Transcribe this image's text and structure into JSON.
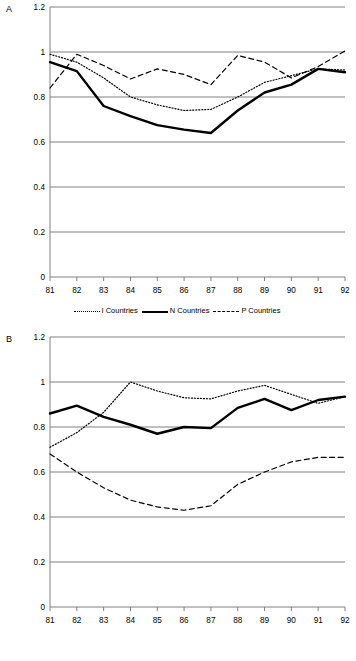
{
  "figure": {
    "panels": [
      {
        "letter": "A"
      },
      {
        "letter": "B"
      }
    ]
  },
  "panel_a": {
    "letter": "A",
    "y_ticks": [
      "0",
      "0.2",
      "0.4",
      "0.6",
      "0.8",
      "1",
      "1.2"
    ],
    "x_ticks": [
      "81",
      "82",
      "83",
      "84",
      "85",
      "86",
      "87",
      "88",
      "89",
      "90",
      "91",
      "92"
    ],
    "legend": [
      {
        "label": "I Countries",
        "style": "dotted"
      },
      {
        "label": "N Countries",
        "style": "solid"
      },
      {
        "label": "P Countries",
        "style": "dashed"
      }
    ]
  },
  "panel_b": {
    "letter": "B",
    "y_ticks": [
      "0",
      "0.2",
      "0.4",
      "0.6",
      "0.8",
      "1",
      "1.2"
    ],
    "x_ticks": [
      "81",
      "82",
      "83",
      "84",
      "85",
      "86",
      "87",
      "88",
      "89",
      "90",
      "91",
      "92"
    ],
    "legend": [
      {
        "label": "Producer Durables",
        "style": "dotted"
      },
      {
        "label": "Producer Nondurables",
        "style": "solid"
      },
      {
        "label": "Consumer Goods",
        "style": "dashed"
      }
    ]
  },
  "chart_data": [
    {
      "type": "line",
      "panel": "A",
      "title": "",
      "xlabel": "",
      "ylabel": "",
      "x": [
        "81",
        "82",
        "83",
        "84",
        "85",
        "86",
        "87",
        "88",
        "89",
        "90",
        "91",
        "92"
      ],
      "xlim": [
        "81",
        "92"
      ],
      "ylim": [
        0,
        1.2
      ],
      "y_ticks": [
        0,
        0.2,
        0.4,
        0.6,
        0.8,
        1.0,
        1.2
      ],
      "grid": true,
      "legend_position": "bottom",
      "series": [
        {
          "name": "I Countries",
          "style": "dotted",
          "values": [
            0.99,
            0.955,
            0.885,
            0.8,
            0.765,
            0.74,
            0.745,
            0.8,
            0.865,
            0.895,
            0.925,
            0.92
          ]
        },
        {
          "name": "N Countries",
          "style": "solid",
          "values": [
            0.955,
            0.915,
            0.76,
            0.715,
            0.675,
            0.655,
            0.64,
            0.74,
            0.82,
            0.855,
            0.925,
            0.91
          ]
        },
        {
          "name": "P Countries",
          "style": "dashed",
          "values": [
            0.84,
            0.99,
            0.94,
            0.88,
            0.925,
            0.9,
            0.855,
            0.985,
            0.955,
            0.885,
            0.935,
            1.005
          ]
        }
      ]
    },
    {
      "type": "line",
      "panel": "B",
      "title": "",
      "xlabel": "",
      "ylabel": "",
      "x": [
        "81",
        "82",
        "83",
        "84",
        "85",
        "86",
        "87",
        "88",
        "89",
        "90",
        "91",
        "92"
      ],
      "xlim": [
        "81",
        "92"
      ],
      "ylim": [
        0,
        1.2
      ],
      "y_ticks": [
        0,
        0.2,
        0.4,
        0.6,
        0.8,
        1.0,
        1.2
      ],
      "grid": true,
      "legend_position": "bottom",
      "series": [
        {
          "name": "Producer Durables",
          "style": "dotted",
          "values": [
            0.71,
            0.775,
            0.865,
            1.0,
            0.96,
            0.93,
            0.925,
            0.96,
            0.985,
            0.945,
            0.905,
            0.935
          ]
        },
        {
          "name": "Producer Nondurables",
          "style": "solid",
          "values": [
            0.86,
            0.895,
            0.845,
            0.81,
            0.77,
            0.8,
            0.795,
            0.885,
            0.925,
            0.875,
            0.92,
            0.935
          ]
        },
        {
          "name": "Consumer Goods",
          "style": "dashed",
          "values": [
            0.68,
            0.6,
            0.53,
            0.475,
            0.445,
            0.43,
            0.45,
            0.545,
            0.6,
            0.645,
            0.665,
            0.665
          ]
        }
      ]
    }
  ],
  "style": {
    "grid_color": "#808080",
    "axis_color": "#808080",
    "line_color": "#000000",
    "background": "#ffffff"
  }
}
